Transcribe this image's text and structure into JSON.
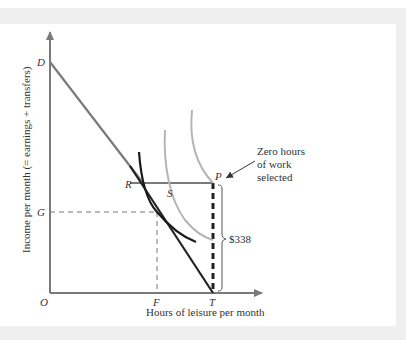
{
  "figure": {
    "y_axis_label": "Income per month (= earnings + transfers)",
    "x_axis_label": "Hours of leisure per month",
    "points": {
      "D": "D",
      "G": "G",
      "O": "O",
      "F": "F",
      "T": "T",
      "R": "R",
      "S": "S",
      "P": "P"
    },
    "annotation": {
      "line1": "Zero hours",
      "line2": "of work",
      "line3": "selected"
    },
    "bracket_label": "$338",
    "colors": {
      "axis": "#7a7a7a",
      "budget_upper": "#7a7a7a",
      "budget_lower": "#222222",
      "indifference_black": "#1a1a1a",
      "indifference_gray": "#b5b5b5",
      "dashed": "#777777",
      "frame": "#efefef"
    }
  }
}
